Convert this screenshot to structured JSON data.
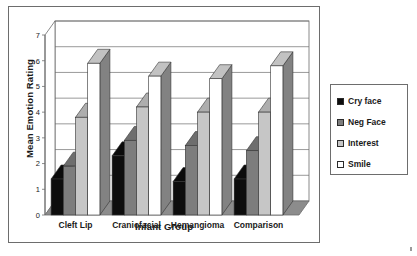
{
  "chart_data": {
    "type": "bar",
    "title": "",
    "xlabel": "Infant Group",
    "ylabel": "Mean Emotion Rating",
    "categories": [
      "Cleft Lip",
      "Craniofacial",
      "Hemangioma",
      "Comparison"
    ],
    "series": [
      {
        "name": "Cry face",
        "color": "#0d0d0d",
        "values": [
          1.4,
          2.3,
          1.3,
          1.4
        ]
      },
      {
        "name": "Neg Face",
        "color": "#7d7d7d",
        "values": [
          1.9,
          2.9,
          2.7,
          2.5
        ]
      },
      {
        "name": "Interest",
        "color": "#c6c6c6",
        "values": [
          3.8,
          4.2,
          4.0,
          4.0
        ]
      },
      {
        "name": "Smile",
        "color": "#ffffff",
        "values": [
          5.9,
          5.4,
          5.3,
          5.8
        ]
      }
    ],
    "ylim": [
      0,
      7
    ],
    "yticks": [
      0,
      1,
      2,
      3,
      4,
      5,
      6,
      7
    ],
    "ytick_labels": [
      "0",
      "1",
      "2",
      "3",
      "4",
      "5",
      "6",
      "7"
    ],
    "grid": true,
    "grid_axis": "y",
    "legend_position": "right",
    "style": "3d-columns",
    "plot_background": "#ffffff",
    "axis_color": "#6d6d6d",
    "floor_color": "#8c8c8c",
    "wall_color": "#ffffff"
  },
  "legend": {
    "items": [
      {
        "label": "Cry face",
        "color": "#0d0d0d"
      },
      {
        "label": "Neg Face",
        "color": "#7d7d7d"
      },
      {
        "label": "Interest",
        "color": "#c6c6c6"
      },
      {
        "label": "Smile",
        "color": "#ffffff"
      }
    ]
  },
  "axes": {
    "y_title": "Mean Emotion Rating",
    "x_title": "Infant Group",
    "y_ticks": [
      "7",
      "6",
      "5",
      "4",
      "3",
      "2",
      "1",
      "0"
    ],
    "x_ticks": [
      "Cleft Lip",
      "Craniofacial",
      "Hemangioma",
      "Comparison"
    ]
  }
}
